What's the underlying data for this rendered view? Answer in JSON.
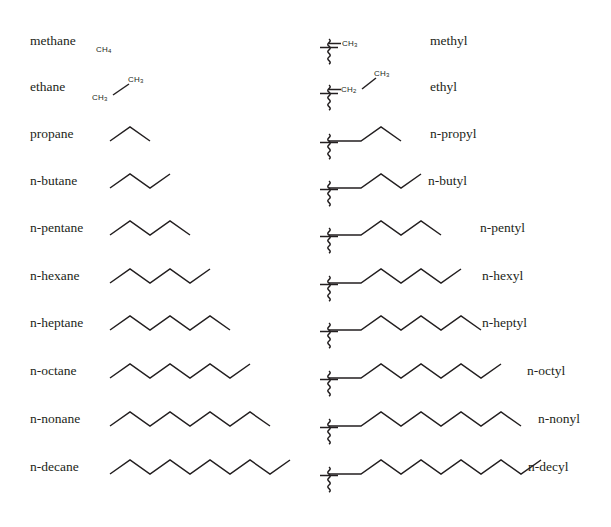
{
  "figure": {
    "background_color": "#ffffff",
    "line_color": "#231f20",
    "columns": {
      "left_header": "alkane",
      "right_header": "alkyl group"
    }
  },
  "rows": [
    {
      "carbons": 1,
      "alkane": "methane",
      "alkyl": "n-pentane-placeholder",
      "alkyl_label": "methyl",
      "alkane_render": "formula",
      "alkane_formula_text": "CH",
      "alkane_formula_sub": "4",
      "alkyl_render": "formula",
      "alkyl_formula_text": "CH",
      "alkyl_formula_sub": "3",
      "alkyl_label_x": 430
    },
    {
      "carbons": 2,
      "alkane": "ethane",
      "alkyl_label": "ethyl",
      "alkane_render": "formula-bond",
      "alkane_formula_left": "CH",
      "alkane_formula_left_sub": "3",
      "alkane_formula_right": "CH",
      "alkane_formula_right_sub": "3",
      "alkyl_render": "formula-bond",
      "alkyl_formula_left": "CH",
      "alkyl_formula_left_sub": "2",
      "alkyl_formula_right": "CH",
      "alkyl_formula_right_sub": "3",
      "alkyl_label_x": 430
    },
    {
      "carbons": 3,
      "alkane": "propane",
      "alkyl_label": "n-propyl",
      "alkane_render": "zigzag",
      "alkane_bonds": 2,
      "alkyl_render": "zigzag",
      "alkyl_bonds": 3,
      "alkyl_label_x": 430
    },
    {
      "carbons": 4,
      "alkane": "n-butane",
      "alkyl_label": "n-butyl",
      "alkane_render": "zigzag",
      "alkane_bonds": 3,
      "alkyl_render": "zigzag",
      "alkyl_bonds": 4,
      "alkyl_label_x": 428
    },
    {
      "carbons": 5,
      "alkane": "n-pentane",
      "alkyl_label": "n-pentyl",
      "alkane_render": "zigzag",
      "alkane_bonds": 4,
      "alkyl_render": "zigzag",
      "alkyl_bonds": 5,
      "alkyl_label_x": 480
    },
    {
      "carbons": 6,
      "alkane": "n-hexane",
      "alkyl_label": "n-hexyl",
      "alkane_render": "zigzag",
      "alkane_bonds": 5,
      "alkyl_render": "zigzag",
      "alkyl_bonds": 6,
      "alkyl_label_x": 482
    },
    {
      "carbons": 7,
      "alkane": "n-heptane",
      "alkyl_label": "n-heptyl",
      "alkane_render": "zigzag",
      "alkane_bonds": 6,
      "alkyl_render": "zigzag",
      "alkyl_bonds": 7,
      "alkyl_label_x": 482
    },
    {
      "carbons": 8,
      "alkane": "n-octane",
      "alkyl_label": "n-octyl",
      "alkane_render": "zigzag",
      "alkane_bonds": 7,
      "alkyl_render": "zigzag",
      "alkyl_bonds": 8,
      "alkyl_label_x": 527
    },
    {
      "carbons": 9,
      "alkane": "n-nonane",
      "alkyl_label": "n-nonyl",
      "alkane_render": "zigzag",
      "alkane_bonds": 8,
      "alkyl_render": "zigzag",
      "alkyl_bonds": 9,
      "alkyl_label_x": 538
    },
    {
      "carbons": 10,
      "alkane": "n-decane",
      "alkyl_label": "n-decyl",
      "alkane_render": "zigzag",
      "alkane_bonds": 9,
      "alkyl_render": "zigzag",
      "alkyl_bonds": 10,
      "alkyl_label_x": 528
    }
  ]
}
